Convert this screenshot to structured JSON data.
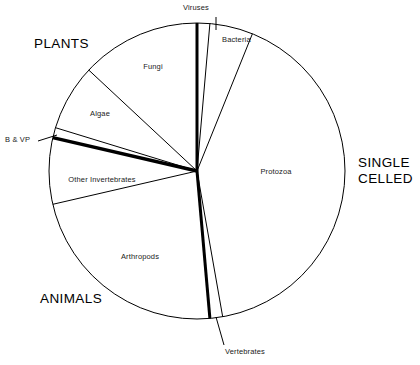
{
  "chart_data": {
    "type": "pie",
    "title": "",
    "subtitle": "",
    "xlabel": "",
    "ylabel": "",
    "grid": false,
    "legend_position": "none",
    "note": "Proportions of described species by group; wedge boundaries read off the drawn radii (clockwise from 12 o'clock).",
    "center": {
      "x": 197,
      "y": 171
    },
    "radius": 148,
    "start_angle_deg": 0,
    "direction": "clockwise",
    "outline_color": "#000000",
    "fill_color": "#ffffff",
    "categories": [
      "Viruses",
      "Bacteria",
      "Protozoa",
      "Vertebrates",
      "Arthropods",
      "Other Invertebrates",
      "B & VP",
      "Algae",
      "Fungi"
    ],
    "values": [
      1.4,
      4.7,
      41.1,
      1.4,
      22.8,
      7.2,
      1.1,
      7.2,
      13.1
    ],
    "slices": [
      {
        "label": "Viruses",
        "start_deg": 0.0,
        "end_deg": 5.0,
        "percent": 1.4,
        "thick_boundary": true,
        "leader": true
      },
      {
        "label": "Bacteria",
        "start_deg": 5.0,
        "end_deg": 22.0,
        "percent": 4.7,
        "thick_boundary": false,
        "leader": false
      },
      {
        "label": "Protozoa",
        "start_deg": 22.0,
        "end_deg": 170.0,
        "percent": 41.1,
        "thick_boundary": false,
        "leader": false
      },
      {
        "label": "Vertebrates",
        "start_deg": 170.0,
        "end_deg": 175.0,
        "percent": 1.4,
        "thick_boundary": true,
        "leader": true
      },
      {
        "label": "Arthropods",
        "start_deg": 175.0,
        "end_deg": 257.0,
        "percent": 22.8,
        "thick_boundary": false,
        "leader": false
      },
      {
        "label": "Other Invertebrates",
        "start_deg": 257.0,
        "end_deg": 283.0,
        "percent": 7.2,
        "thick_boundary": false,
        "leader": false
      },
      {
        "label": "B & VP",
        "start_deg": 283.0,
        "end_deg": 287.0,
        "percent": 1.1,
        "thick_boundary": true,
        "leader": true
      },
      {
        "label": "Algae",
        "start_deg": 287.0,
        "end_deg": 313.0,
        "percent": 7.2,
        "thick_boundary": false,
        "leader": false
      },
      {
        "label": "Fungi",
        "start_deg": 313.0,
        "end_deg": 360.0,
        "percent": 13.1,
        "thick_boundary": false,
        "leader": false
      }
    ],
    "group_labels": [
      {
        "text": "PLANTS",
        "position": "upper-left"
      },
      {
        "text": "SINGLE\nCELLED",
        "position": "right"
      },
      {
        "text": "ANIMALS",
        "position": "lower-left"
      }
    ]
  },
  "slice_labels": {
    "viruses": "Viruses",
    "bacteria": "Bacteria",
    "protozoa": "Protozoa",
    "vertebrates": "Vertebrates",
    "arthropods": "Arthropods",
    "other_invertebrates": "Other Invertebrates",
    "b_and_vp": "B & VP",
    "algae": "Algae",
    "fungi": "Fungi"
  },
  "group_labels": {
    "plants": "PLANTS",
    "single_celled_line1": "SINGLE",
    "single_celled_line2": "CELLED",
    "animals": "ANIMALS"
  },
  "colors": {
    "stroke": "#000000",
    "fill": "#ffffff",
    "text": "#1a1a1a",
    "group_text": "#000000"
  }
}
